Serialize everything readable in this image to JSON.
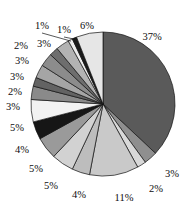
{
  "chart_data": {
    "type": "pie",
    "title": "",
    "subtitle": "",
    "xlabel": "",
    "ylabel": "",
    "legend": "none",
    "grid": false,
    "units": "percent",
    "start_angle_deg": 0,
    "direction": "clockwise",
    "total": 100,
    "categories": [
      "Slice 1",
      "Slice 2",
      "Slice 3",
      "Slice 4",
      "Slice 5",
      "Slice 6",
      "Slice 7",
      "Slice 8",
      "Slice 9",
      "Slice 10",
      "Slice 11",
      "Slice 12",
      "Slice 13",
      "Slice 14",
      "Slice 15",
      "Slice 16",
      "Slice 17",
      "Slice 18"
    ],
    "values": [
      37,
      3,
      2,
      11,
      4,
      5,
      5,
      4,
      5,
      3,
      2,
      3,
      3,
      2,
      3,
      1,
      1,
      6
    ],
    "labels": [
      "37%",
      "3%",
      "2%",
      "11%",
      "4%",
      "5%",
      "5%",
      "4%",
      "5%",
      "3%",
      "2%",
      "3%",
      "3%",
      "2%",
      "3%",
      "1%",
      "1%",
      "6%"
    ],
    "colors": [
      "#5a5a5a",
      "#8f8f8f",
      "#d9d9d9",
      "#c9c9c9",
      "#bdbdbd",
      "#d2d2d2",
      "#9a9a9a",
      "#161616",
      "#f2f2f2",
      "#8a8a8a",
      "#636363",
      "#a5a5a5",
      "#8c8c8c",
      "#6e6e6e",
      "#b3b3b3",
      "#ededed",
      "#1a1a1a",
      "#e6e6e6"
    ],
    "label_positions": [
      {
        "x": 152,
        "y": 38,
        "anchor": "middle",
        "leader": false
      },
      {
        "x": 172,
        "y": 175,
        "anchor": "middle",
        "leader": false
      },
      {
        "x": 156,
        "y": 190,
        "anchor": "middle",
        "leader": false
      },
      {
        "x": 124,
        "y": 199,
        "anchor": "middle",
        "leader": false
      },
      {
        "x": 79,
        "y": 196,
        "anchor": "middle",
        "leader": false
      },
      {
        "x": 51,
        "y": 187,
        "anchor": "middle",
        "leader": false
      },
      {
        "x": 36,
        "y": 170,
        "anchor": "middle",
        "leader": false
      },
      {
        "x": 22,
        "y": 151,
        "anchor": "middle",
        "leader": false
      },
      {
        "x": 17,
        "y": 129,
        "anchor": "middle",
        "leader": false
      },
      {
        "x": 13,
        "y": 108,
        "anchor": "middle",
        "leader": false
      },
      {
        "x": 15,
        "y": 93,
        "anchor": "middle",
        "leader": false
      },
      {
        "x": 17,
        "y": 78,
        "anchor": "middle",
        "leader": false
      },
      {
        "x": 22,
        "y": 62,
        "anchor": "middle",
        "leader": false
      },
      {
        "x": 21,
        "y": 47,
        "anchor": "middle",
        "leader": false
      },
      {
        "x": 44,
        "y": 45,
        "anchor": "middle",
        "leader": false
      },
      {
        "x": 42,
        "y": 27,
        "anchor": "middle",
        "leader": true
      },
      {
        "x": 64,
        "y": 31,
        "anchor": "middle",
        "leader": true
      },
      {
        "x": 87,
        "y": 27,
        "anchor": "middle",
        "leader": false
      }
    ],
    "geometry": {
      "cx": 103,
      "cy": 104,
      "r": 72,
      "label_radius": 86
    }
  }
}
